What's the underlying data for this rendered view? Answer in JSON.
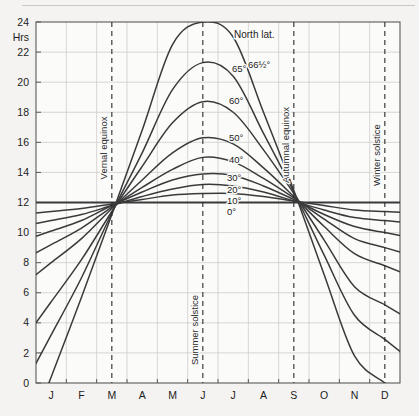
{
  "figure": {
    "name": "daylight-hours-by-latitude-chart",
    "axis_unit_label": "Hrs",
    "background_color": "#f4f3f1",
    "plot_background_color": "#fbfbfa",
    "grid_color": "#cfcdca",
    "curve_color": "#3a3a3a",
    "axis_color": "#5a5a5a",
    "legend_title": "North lat."
  },
  "chart_data": {
    "type": "line",
    "title": "",
    "subtitle": "",
    "xlabel": "",
    "ylabel": "Hrs",
    "ylim": [
      0,
      24
    ],
    "ytick_step": 2,
    "yticks": [
      0,
      2,
      4,
      6,
      8,
      10,
      12,
      14,
      16,
      18,
      20,
      22,
      24
    ],
    "ytick_labels": [
      "0",
      "2",
      "4",
      "6",
      "8",
      "10",
      "12",
      "14",
      "16",
      "18",
      "20",
      "22",
      "24"
    ],
    "categories": [
      "J",
      "F",
      "M",
      "A",
      "M",
      "J",
      "J",
      "A",
      "S",
      "O",
      "N",
      "D"
    ],
    "xtick_labels": [
      "J",
      "F",
      "M",
      "A",
      "M",
      "J",
      "J",
      "A",
      "S",
      "O",
      "N",
      "D"
    ],
    "grid": true,
    "legend_position": "inline-right-of-curves",
    "x_axis_description": "months of the year, January through December",
    "x_points_months": [
      0.5,
      1.5,
      2.5,
      3.5,
      4.5,
      5.5,
      6.5,
      7.5,
      8.5,
      9.5,
      10.5,
      11.5
    ],
    "series": [
      {
        "name": "0°",
        "label": "0°",
        "values": [
          12,
          12,
          12,
          12,
          12,
          12,
          12,
          12,
          12,
          12,
          12,
          12
        ]
      },
      {
        "name": "10°",
        "label": "10°",
        "values": [
          11.4,
          11.6,
          11.9,
          12.2,
          12.5,
          12.6,
          12.6,
          12.4,
          12.1,
          11.8,
          11.5,
          11.4
        ]
      },
      {
        "name": "20°",
        "label": "20°",
        "values": [
          10.8,
          11.2,
          11.8,
          12.4,
          12.9,
          13.2,
          13.1,
          12.7,
          12.1,
          11.5,
          11.0,
          10.8
        ]
      },
      {
        "name": "30°",
        "label": "30°",
        "values": [
          10.1,
          10.8,
          11.8,
          12.7,
          13.5,
          13.9,
          13.8,
          13.1,
          12.2,
          11.2,
          10.4,
          10.0
        ]
      },
      {
        "name": "40°",
        "label": "40°",
        "values": [
          9.2,
          10.3,
          11.7,
          13.0,
          14.2,
          15.0,
          14.7,
          13.6,
          12.3,
          10.9,
          9.6,
          9.0
        ]
      },
      {
        "name": "50°",
        "label": "50°",
        "values": [
          8.0,
          9.6,
          11.6,
          13.5,
          15.3,
          16.3,
          15.9,
          14.3,
          12.4,
          10.4,
          8.6,
          7.8
        ]
      },
      {
        "name": "60°",
        "label": "60°",
        "values": [
          5.4,
          8.2,
          11.4,
          14.4,
          17.3,
          18.7,
          18.0,
          15.5,
          12.6,
          9.5,
          6.4,
          5.2
        ]
      },
      {
        "name": "65°",
        "label": "65°",
        "values": [
          3.2,
          7.0,
          11.3,
          15.3,
          19.5,
          21.3,
          20.4,
          16.6,
          12.7,
          8.5,
          4.5,
          2.9
        ]
      },
      {
        "name": "66½°",
        "label": "66½°",
        "values": [
          0.4,
          5.7,
          11.2,
          16.8,
          22.5,
          24.0,
          23.0,
          18.0,
          12.8,
          7.2,
          1.8,
          0.0
        ]
      }
    ],
    "annotations": [
      {
        "text": "Vernal equinox",
        "x_month": 2.5,
        "orientation": "vertical",
        "line": "dashed"
      },
      {
        "text": "Summer solstice",
        "x_month": 5.5,
        "orientation": "vertical",
        "line": "dashed"
      },
      {
        "text": "Autumnal equinox",
        "x_month": 8.5,
        "orientation": "vertical",
        "line": "dashed"
      },
      {
        "text": "Winter solstice",
        "x_month": 11.5,
        "orientation": "vertical",
        "line": "dashed"
      },
      {
        "text": "North lat.",
        "type": "legend-title"
      }
    ]
  }
}
